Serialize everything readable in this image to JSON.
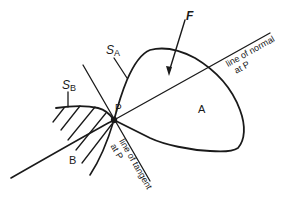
{
  "diagram": {
    "labels": {
      "force": "F",
      "surface_a": "S",
      "surface_a_sub": "A",
      "surface_b": "S",
      "surface_b_sub": "B",
      "point": "P",
      "body_a": "A",
      "body_b": "B",
      "normal_line_1": "line of normal",
      "normal_line_2": "at P",
      "tangent_line_1": "line of tangent",
      "tangent_line_2": "at P"
    },
    "colors": {
      "stroke": "#1a1a1a",
      "background": "#ffffff"
    }
  }
}
